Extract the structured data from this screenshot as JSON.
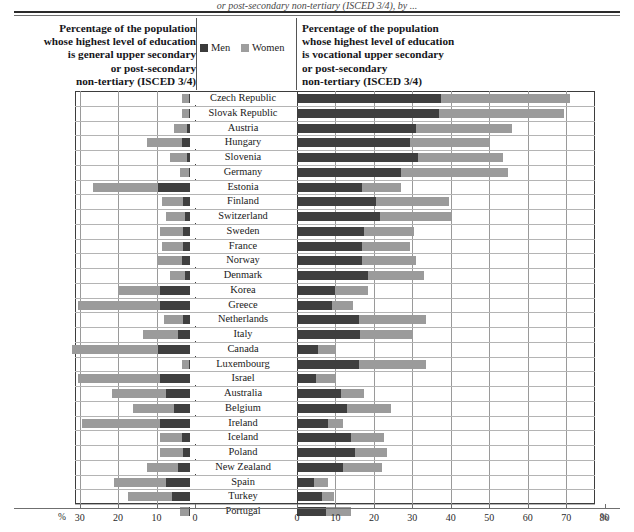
{
  "caption": {
    "top_partial": "or post-secondary non-tertiary (ISCED 3/4), by ..."
  },
  "header": {
    "left_title": "Percentage of the population\nwhose highest level of education\nis general upper secondary\nor post-secondary\nnon-tertiary  (ISCED 3/4)",
    "right_title": "Percentage of the population\nwhose highest level of education\nis vocational upper secondary\nor post-secondary\nnon-tertiary  (ISCED 3/4)"
  },
  "legend": {
    "men_label": "Men",
    "women_label": "Women",
    "men_color": "#3b3b3b",
    "women_color": "#9e9e9e"
  },
  "axis": {
    "left_unit": "%",
    "right_unit": "%",
    "left_ticks": [
      "30",
      "20",
      "10",
      "0"
    ],
    "right_ticks": [
      "0",
      "10",
      "20",
      "30",
      "40",
      "50",
      "60",
      "70",
      "80"
    ]
  },
  "chart_data": {
    "type": "bar",
    "orientation": "horizontal",
    "layout": "back-to-back stacked bars (butterfly / tornado chart)",
    "left_panel": {
      "label": "Percentage of the population whose highest level of education is general upper secondary or post-secondary non-tertiary (ISCED 3/4)",
      "direction": "right-to-left",
      "axis_range": [
        0,
        30
      ],
      "axis_ticks": [
        30,
        20,
        10,
        0
      ],
      "unit": "%"
    },
    "right_panel": {
      "label": "Percentage of the population whose highest level of education is vocational upper secondary or post-secondary non-tertiary (ISCED 3/4)",
      "direction": "left-to-right",
      "axis_range": [
        0,
        80
      ],
      "axis_ticks": [
        0,
        10,
        20,
        30,
        40,
        50,
        60,
        70,
        80
      ],
      "unit": "%"
    },
    "series": [
      "Men",
      "Women"
    ],
    "grid": "vertical gridlines every 10 percentage points",
    "categories": [
      "Czech Republic",
      "Slovak Republic",
      "Austria",
      "Hungary",
      "Slovenia",
      "Germany",
      "Estonia",
      "Finland",
      "Switzerland",
      "Sweden",
      "France",
      "Norway",
      "Denmark",
      "Korea",
      "Greece",
      "Netherlands",
      "Italy",
      "Canada",
      "Luxembourg",
      "Israel",
      "Australia",
      "Belgium",
      "Ireland",
      "Iceland",
      "Poland",
      "New Zealand",
      "Spain",
      "Turkey",
      "Portugal"
    ],
    "rows": [
      {
        "country": "Czech Republic",
        "general_men": 1.5,
        "general_women": 2.0,
        "vocational_men": 37.5,
        "vocational_women": 33.5
      },
      {
        "country": "Slovak Republic",
        "general_men": 1.5,
        "general_women": 2.0,
        "vocational_men": 37.0,
        "vocational_women": 32.5
      },
      {
        "country": "Austria",
        "general_men": 2.0,
        "general_women": 3.5,
        "vocational_men": 31.0,
        "vocational_women": 25.0
      },
      {
        "country": "Hungary",
        "general_men": 3.5,
        "general_women": 9.0,
        "vocational_men": 29.5,
        "vocational_women": 20.5
      },
      {
        "country": "Slovenia",
        "general_men": 2.0,
        "general_women": 4.5,
        "vocational_men": 31.5,
        "vocational_women": 22.0
      },
      {
        "country": "Germany",
        "general_men": 1.5,
        "general_women": 2.5,
        "vocational_men": 27.0,
        "vocational_women": 28.0
      },
      {
        "country": "Estonia",
        "general_men": 9.5,
        "general_women": 17.0,
        "vocational_men": 17.0,
        "vocational_women": 10.0
      },
      {
        "country": "Finland",
        "general_men": 3.0,
        "general_women": 5.5,
        "vocational_men": 20.5,
        "vocational_women": 19.0
      },
      {
        "country": "Switzerland",
        "general_men": 2.5,
        "general_women": 5.0,
        "vocational_men": 21.5,
        "vocational_women": 18.5
      },
      {
        "country": "Sweden",
        "general_men": 3.0,
        "general_women": 6.0,
        "vocational_men": 17.5,
        "vocational_women": 13.0
      },
      {
        "country": "France",
        "general_men": 3.0,
        "general_women": 5.5,
        "vocational_men": 17.0,
        "vocational_women": 12.5
      },
      {
        "country": "Norway",
        "general_men": 3.5,
        "general_women": 6.5,
        "vocational_men": 17.0,
        "vocational_women": 14.0
      },
      {
        "country": "Denmark",
        "general_men": 2.5,
        "general_women": 4.0,
        "vocational_men": 18.5,
        "vocational_women": 14.5
      },
      {
        "country": "Korea",
        "general_men": 9.0,
        "general_women": 11.0,
        "vocational_men": 10.0,
        "vocational_women": 8.5
      },
      {
        "country": "Greece",
        "general_men": 9.0,
        "general_women": 21.5,
        "vocational_men": 9.0,
        "vocational_women": 5.5
      },
      {
        "country": "Netherlands",
        "general_men": 3.0,
        "general_women": 5.0,
        "vocational_men": 16.0,
        "vocational_women": 17.5
      },
      {
        "country": "Italy",
        "general_men": 4.5,
        "general_women": 9.0,
        "vocational_men": 16.5,
        "vocational_women": 13.5
      },
      {
        "country": "Canada",
        "general_men": 9.5,
        "general_women": 22.5,
        "vocational_men": 5.5,
        "vocational_women": 4.5
      },
      {
        "country": "Luxembourg",
        "general_men": 1.5,
        "general_women": 2.0,
        "vocational_men": 16.0,
        "vocational_women": 17.5
      },
      {
        "country": "Israel",
        "general_men": 9.0,
        "general_women": 21.5,
        "vocational_men": 5.0,
        "vocational_women": 5.0
      },
      {
        "country": "Australia",
        "general_men": 7.5,
        "general_women": 14.0,
        "vocational_men": 11.5,
        "vocational_women": 6.0
      },
      {
        "country": "Belgium",
        "general_men": 5.5,
        "general_women": 10.5,
        "vocational_men": 13.0,
        "vocational_women": 11.5
      },
      {
        "country": "Ireland",
        "general_men": 9.0,
        "general_women": 20.5,
        "vocational_men": 8.0,
        "vocational_women": 4.0
      },
      {
        "country": "Iceland",
        "general_men": 3.5,
        "general_women": 5.5,
        "vocational_men": 14.0,
        "vocational_women": 8.5
      },
      {
        "country": "Poland",
        "general_men": 3.0,
        "general_women": 6.0,
        "vocational_men": 15.0,
        "vocational_women": 8.5
      },
      {
        "country": "New Zealand",
        "general_men": 4.5,
        "general_women": 8.0,
        "vocational_men": 12.0,
        "vocational_women": 10.0
      },
      {
        "country": "Spain",
        "general_men": 7.5,
        "general_women": 13.5,
        "vocational_men": 4.5,
        "vocational_women": 3.5
      },
      {
        "country": "Turkey",
        "general_men": 6.0,
        "general_women": 11.5,
        "vocational_men": 6.5,
        "vocational_women": 3.0
      },
      {
        "country": "Portugal",
        "general_men": 1.5,
        "general_women": 2.5,
        "vocational_men": 7.5,
        "vocational_women": 6.5
      }
    ]
  }
}
